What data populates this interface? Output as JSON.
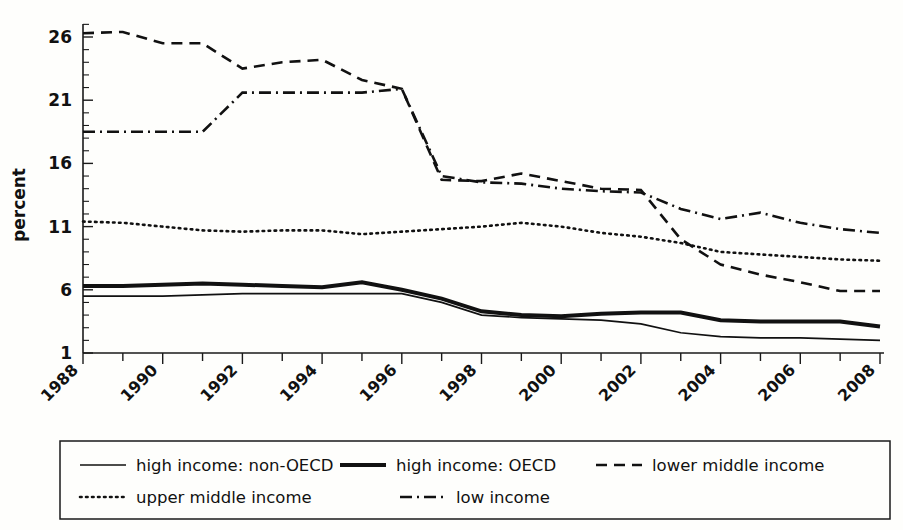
{
  "chart_data": {
    "type": "line",
    "title": "",
    "xlabel": "",
    "ylabel": "percent",
    "xlim": [
      1988,
      2008
    ],
    "ylim": [
      1,
      27.5
    ],
    "grid": false,
    "legend_position": "bottom",
    "x": [
      1988,
      1989,
      1990,
      1991,
      1992,
      1993,
      1994,
      1995,
      1996,
      1997,
      1998,
      1999,
      2000,
      2001,
      2002,
      2003,
      2004,
      2005,
      2006,
      2007,
      2008
    ],
    "xticks": [
      1988,
      1989,
      1990,
      1991,
      1992,
      1993,
      1994,
      1995,
      1996,
      1997,
      1998,
      1999,
      2000,
      2001,
      2002,
      2003,
      2004,
      2005,
      2006,
      2007,
      2008
    ],
    "xtick_labels": [
      "1988",
      "",
      "1990",
      "",
      "1992",
      "",
      "1994",
      "",
      "1996",
      "",
      "1998",
      "",
      "2000",
      "",
      "2002",
      "",
      "2004",
      "",
      "2006",
      "",
      "2008"
    ],
    "yticks": [
      1,
      6,
      11,
      16,
      21,
      26
    ],
    "ytick_labels": [
      "1",
      "6",
      "11",
      "16",
      "21",
      "26"
    ],
    "yminor_ticks": [
      2,
      3,
      4,
      5,
      7,
      8,
      9,
      10,
      12,
      13,
      14,
      15,
      17,
      18,
      19,
      20,
      22,
      23,
      24,
      25,
      27
    ],
    "series": [
      {
        "name": "high income: non-OECD",
        "style": "solid-thin",
        "values": [
          5.5,
          5.5,
          5.5,
          5.6,
          5.7,
          5.7,
          5.7,
          5.7,
          5.7,
          5.0,
          4.0,
          3.8,
          3.7,
          3.6,
          3.3,
          2.6,
          2.3,
          2.2,
          2.2,
          2.1,
          2.0
        ]
      },
      {
        "name": "high income: OECD",
        "style": "solid-thick",
        "values": [
          6.3,
          6.3,
          6.4,
          6.5,
          6.4,
          6.3,
          6.2,
          6.6,
          6.0,
          5.3,
          4.3,
          4.0,
          3.9,
          4.1,
          4.2,
          4.2,
          3.6,
          3.5,
          3.5,
          3.5,
          3.1
        ]
      },
      {
        "name": "lower middle income",
        "style": "dashed",
        "values": [
          26.3,
          26.4,
          25.5,
          25.5,
          23.5,
          24.0,
          24.2,
          22.6,
          21.9,
          14.7,
          14.6,
          15.2,
          14.6,
          14.0,
          13.9,
          10.0,
          8.0,
          7.2,
          6.6,
          5.9,
          5.9
        ]
      },
      {
        "name": "upper middle income",
        "style": "dotted",
        "values": [
          11.4,
          11.3,
          11.0,
          10.7,
          10.6,
          10.7,
          10.7,
          10.4,
          10.6,
          10.8,
          11.0,
          11.3,
          11.0,
          10.5,
          10.2,
          9.7,
          9.0,
          8.8,
          8.6,
          8.4,
          8.3
        ]
      },
      {
        "name": "low income",
        "style": "dash-dot",
        "values": [
          18.5,
          18.5,
          18.5,
          18.5,
          21.6,
          21.6,
          21.6,
          21.6,
          21.9,
          15.0,
          14.5,
          14.4,
          14.0,
          13.8,
          13.7,
          12.4,
          11.6,
          12.1,
          11.3,
          10.8,
          10.5
        ]
      }
    ]
  },
  "axis": {
    "ylabel": "percent"
  },
  "legend": {
    "items": [
      {
        "label": "high income: non-OECD",
        "style": "solid-thin"
      },
      {
        "label": "high income: OECD",
        "style": "solid-thick"
      },
      {
        "label": "lower middle income",
        "style": "dashed"
      },
      {
        "label": "upper middle income",
        "style": "dotted"
      },
      {
        "label": "low income",
        "style": "dash-dot"
      }
    ]
  }
}
